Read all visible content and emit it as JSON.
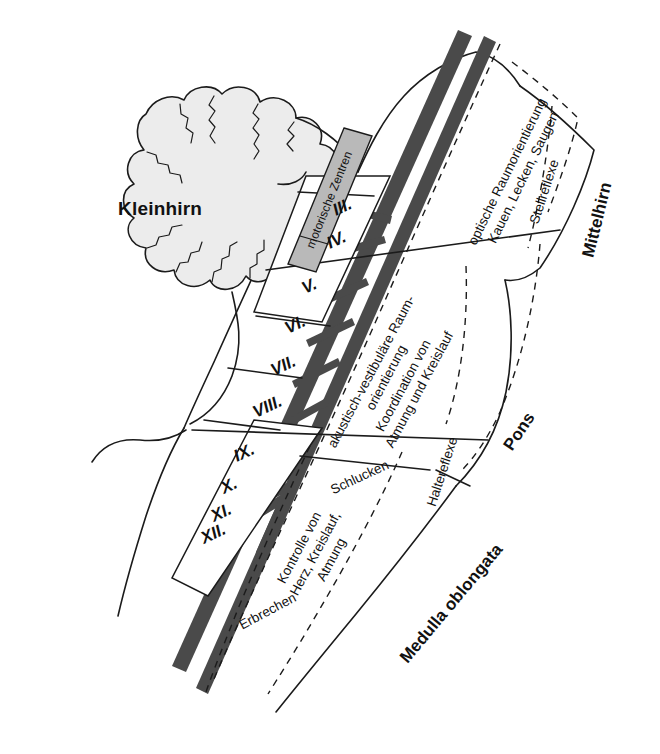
{
  "figure": {
    "language": "de",
    "colors": {
      "outline": "#1b1b1b",
      "cerebellum_fill": "#ececec",
      "tract_band": "#4a4a4a",
      "motor_band_fill": "#b9b9b9",
      "background": "#ffffff"
    }
  },
  "cerebellum": {
    "label": "Kleinhirn"
  },
  "motor_band": {
    "label": "motorische Zentren"
  },
  "cranial_nerves": {
    "box_label": "Hirnnerven",
    "items": [
      {
        "numeral": "III."
      },
      {
        "numeral": "IV."
      },
      {
        "numeral": "V."
      },
      {
        "numeral": "VI."
      },
      {
        "numeral": "VII."
      },
      {
        "numeral": "VIII."
      },
      {
        "numeral": "IX."
      },
      {
        "numeral": "X."
      },
      {
        "numeral": "XI."
      },
      {
        "numeral": "XII."
      }
    ]
  },
  "regions": [
    {
      "key": "mittelhirn",
      "label": "Mittelhirn"
    },
    {
      "key": "pons",
      "label": "Pons"
    },
    {
      "key": "medulla",
      "label": "Medulla oblongata"
    }
  ],
  "functions": {
    "midbrain": [
      "optische Raumorientierung",
      "Kauen, Lecken, Saugen"
    ],
    "midbrain_reflex": "Stellreflexe",
    "pons": [
      "akustisch-vestibuläre Raum-",
      "orientierung",
      "Koordination von",
      "Atmung und Kreislauf"
    ],
    "pons_swallow": "Schlucken",
    "pons_reflex": "Haltereflexe",
    "medulla": [
      "Kontrolle von",
      "Herz, Kreislauf,",
      "Atmung"
    ],
    "medulla_vomit": "Erbrechen"
  }
}
